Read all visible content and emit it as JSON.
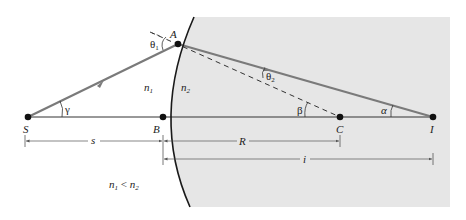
{
  "figure": {
    "colors": {
      "background": "#ffffff",
      "medium2_fill": "#e6e6e6",
      "ray": "#7a7a7a",
      "surface": "#1a1a1a",
      "axis": "#333333",
      "dimension": "#555555"
    },
    "points": {
      "S": {
        "label": "S",
        "x": 28,
        "y": 117
      },
      "A": {
        "label": "A",
        "x": 178,
        "y": 44
      },
      "B": {
        "label": "B",
        "x": 163,
        "y": 117
      },
      "C": {
        "label": "C",
        "x": 340,
        "y": 117
      },
      "I": {
        "label": "I",
        "x": 433,
        "y": 117
      }
    },
    "angles": {
      "theta1": "θ",
      "theta1_sub": "1",
      "theta2": "θ",
      "theta2_sub": "2",
      "gamma": "γ",
      "beta": "β",
      "alpha": "α"
    },
    "media": {
      "n1": "n",
      "n1_sub": "1",
      "n2": "n",
      "n2_sub": "2"
    },
    "dimensions": {
      "s": "s",
      "R": "R",
      "i": "i"
    },
    "condition": {
      "lhs": "n",
      "lhs_sub": "1",
      "op": " < ",
      "rhs": "n",
      "rhs_sub": "2"
    }
  }
}
